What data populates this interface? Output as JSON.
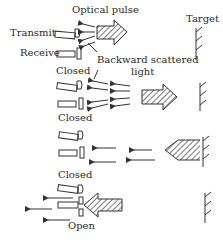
{
  "labels": {
    "optical_pulse": "Optical pulse",
    "target": "Target",
    "transmit": "Transmit",
    "receive": "Receive",
    "backward_scattered_1": "Backward scattered",
    "backward_scattered_2": "light",
    "closed_1": "Closed",
    "closed_2": "Closed",
    "closed_3": "Closed",
    "open": "Open"
  },
  "panels": [
    {
      "stage": 1,
      "pulse_direction": "right",
      "receiver_state": "closed",
      "scattered_light": true
    },
    {
      "stage": 2,
      "pulse_direction": "right",
      "receiver_state": "closed",
      "scattered_light": true
    },
    {
      "stage": 3,
      "pulse_direction": "left",
      "receiver_state": "closed",
      "scattered_light": true
    },
    {
      "stage": 4,
      "pulse_direction": "left",
      "receiver_state": "open",
      "scattered_light": true
    }
  ]
}
